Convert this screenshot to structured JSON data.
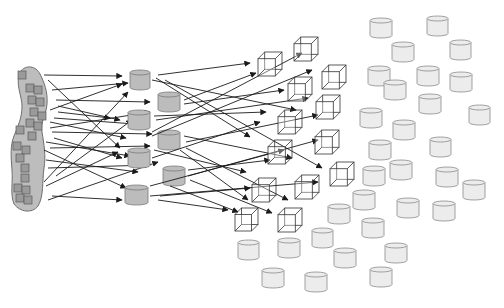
{
  "diagram": {
    "title": "",
    "colors": {
      "background": "#ffffff",
      "blob_fill": "#bdbdbd",
      "blob_stroke": "#6e6e6e",
      "blob_square_fill": "#9a9a9a",
      "blob_square_stroke": "#5a5a5a",
      "gray_cylinder_fill": "#bcbcbc",
      "gray_cylinder_stroke": "#7a7a7a",
      "light_cylinder_fill": "#ececec",
      "light_cylinder_stroke": "#8a8a8a",
      "cube_stroke": "#333333",
      "arrow": "#1a1a1a"
    },
    "source_blob": {
      "name": "source-cluster",
      "squares": [
        [
          22,
          75
        ],
        [
          30,
          88
        ],
        [
          38,
          90
        ],
        [
          32,
          100
        ],
        [
          40,
          102
        ],
        [
          34,
          112
        ],
        [
          42,
          116
        ],
        [
          30,
          123
        ],
        [
          38,
          126
        ],
        [
          20,
          130
        ],
        [
          32,
          136
        ],
        [
          17,
          146
        ],
        [
          26,
          150
        ],
        [
          20,
          158
        ],
        [
          25,
          168
        ],
        [
          25,
          178
        ],
        [
          18,
          188
        ],
        [
          26,
          190
        ],
        [
          20,
          198
        ],
        [
          28,
          200
        ]
      ]
    },
    "gray_cylinders": [
      {
        "x": 130,
        "y": 70,
        "w": 20,
        "h": 20
      },
      {
        "x": 158,
        "y": 92,
        "w": 22,
        "h": 20
      },
      {
        "x": 128,
        "y": 110,
        "w": 22,
        "h": 20
      },
      {
        "x": 158,
        "y": 130,
        "w": 22,
        "h": 20
      },
      {
        "x": 128,
        "y": 148,
        "w": 22,
        "h": 20
      },
      {
        "x": 163,
        "y": 166,
        "w": 22,
        "h": 20
      },
      {
        "x": 125,
        "y": 185,
        "w": 23,
        "h": 20
      }
    ],
    "cubes": [
      {
        "x": 258,
        "y": 52,
        "s": 24
      },
      {
        "x": 294,
        "y": 37,
        "s": 24
      },
      {
        "x": 322,
        "y": 65,
        "s": 24
      },
      {
        "x": 288,
        "y": 77,
        "s": 24
      },
      {
        "x": 316,
        "y": 95,
        "s": 24
      },
      {
        "x": 278,
        "y": 110,
        "s": 24
      },
      {
        "x": 315,
        "y": 130,
        "s": 24
      },
      {
        "x": 268,
        "y": 140,
        "s": 24
      },
      {
        "x": 330,
        "y": 162,
        "s": 24
      },
      {
        "x": 252,
        "y": 178,
        "s": 24
      },
      {
        "x": 295,
        "y": 175,
        "s": 24
      },
      {
        "x": 235,
        "y": 208,
        "s": 23
      },
      {
        "x": 278,
        "y": 208,
        "s": 24
      }
    ],
    "light_cylinders": [
      {
        "x": 370,
        "y": 18,
        "w": 22,
        "h": 20
      },
      {
        "x": 427,
        "y": 16,
        "w": 21,
        "h": 20
      },
      {
        "x": 392,
        "y": 42,
        "w": 22,
        "h": 20
      },
      {
        "x": 450,
        "y": 40,
        "w": 21,
        "h": 20
      },
      {
        "x": 368,
        "y": 66,
        "w": 22,
        "h": 20
      },
      {
        "x": 417,
        "y": 66,
        "w": 22,
        "h": 20
      },
      {
        "x": 450,
        "y": 72,
        "w": 22,
        "h": 20
      },
      {
        "x": 384,
        "y": 80,
        "w": 22,
        "h": 20
      },
      {
        "x": 419,
        "y": 94,
        "w": 22,
        "h": 20
      },
      {
        "x": 469,
        "y": 105,
        "w": 21,
        "h": 20
      },
      {
        "x": 360,
        "y": 108,
        "w": 22,
        "h": 20
      },
      {
        "x": 393,
        "y": 120,
        "w": 22,
        "h": 20
      },
      {
        "x": 430,
        "y": 137,
        "w": 21,
        "h": 20
      },
      {
        "x": 369,
        "y": 140,
        "w": 22,
        "h": 20
      },
      {
        "x": 390,
        "y": 160,
        "w": 22,
        "h": 20
      },
      {
        "x": 363,
        "y": 166,
        "w": 22,
        "h": 20
      },
      {
        "x": 436,
        "y": 167,
        "w": 22,
        "h": 20
      },
      {
        "x": 463,
        "y": 180,
        "w": 22,
        "h": 20
      },
      {
        "x": 353,
        "y": 190,
        "w": 22,
        "h": 20
      },
      {
        "x": 397,
        "y": 198,
        "w": 22,
        "h": 20
      },
      {
        "x": 433,
        "y": 201,
        "w": 22,
        "h": 20
      },
      {
        "x": 328,
        "y": 204,
        "w": 22,
        "h": 20
      },
      {
        "x": 362,
        "y": 218,
        "w": 22,
        "h": 20
      },
      {
        "x": 312,
        "y": 228,
        "w": 21,
        "h": 20
      },
      {
        "x": 238,
        "y": 240,
        "w": 21,
        "h": 20
      },
      {
        "x": 278,
        "y": 238,
        "w": 22,
        "h": 20
      },
      {
        "x": 385,
        "y": 243,
        "w": 22,
        "h": 20
      },
      {
        "x": 334,
        "y": 248,
        "w": 22,
        "h": 20
      },
      {
        "x": 262,
        "y": 268,
        "w": 22,
        "h": 20
      },
      {
        "x": 370,
        "y": 267,
        "w": 22,
        "h": 20
      },
      {
        "x": 305,
        "y": 272,
        "w": 22,
        "h": 20
      }
    ],
    "arrows_stage1": [
      [
        44,
        75,
        122,
        76
      ],
      [
        48,
        80,
        120,
        148
      ],
      [
        52,
        90,
        128,
        83
      ],
      [
        56,
        100,
        150,
        102
      ],
      [
        58,
        106,
        120,
        120
      ],
      [
        58,
        112,
        110,
        118
      ],
      [
        54,
        118,
        148,
        125
      ],
      [
        50,
        122,
        126,
        138
      ],
      [
        52,
        132,
        152,
        134
      ],
      [
        54,
        138,
        122,
        158
      ],
      [
        46,
        142,
        130,
        156
      ],
      [
        50,
        148,
        150,
        146
      ],
      [
        44,
        150,
        126,
        188
      ],
      [
        46,
        160,
        138,
        172
      ],
      [
        48,
        168,
        150,
        165
      ],
      [
        56,
        176,
        132,
        120
      ],
      [
        44,
        182,
        128,
        92
      ],
      [
        52,
        196,
        122,
        200
      ],
      [
        48,
        200,
        158,
        162
      ],
      [
        46,
        186,
        118,
        152
      ],
      [
        50,
        110,
        122,
        84
      ],
      [
        50,
        128,
        150,
        112
      ]
    ],
    "arrows_stage2": [
      [
        158,
        75,
        250,
        63
      ],
      [
        156,
        78,
        250,
        137
      ],
      [
        152,
        80,
        296,
        110
      ],
      [
        184,
        100,
        256,
        73
      ],
      [
        184,
        104,
        284,
        90
      ],
      [
        154,
        116,
        266,
        112
      ],
      [
        156,
        120,
        308,
        98
      ],
      [
        184,
        136,
        292,
        158
      ],
      [
        152,
        132,
        302,
        53
      ],
      [
        152,
        136,
        312,
        70
      ],
      [
        154,
        150,
        246,
        172
      ],
      [
        186,
        142,
        318,
        115
      ],
      [
        186,
        148,
        288,
        200
      ],
      [
        152,
        158,
        260,
        122
      ],
      [
        188,
        170,
        270,
        160
      ],
      [
        188,
        176,
        318,
        140
      ],
      [
        150,
        186,
        284,
        150
      ],
      [
        150,
        196,
        318,
        182
      ],
      [
        160,
        196,
        250,
        188
      ],
      [
        158,
        200,
        228,
        210
      ],
      [
        190,
        180,
        272,
        213
      ],
      [
        170,
        186,
        238,
        212
      ],
      [
        180,
        150,
        248,
        200
      ],
      [
        165,
        80,
        322,
        168
      ]
    ]
  }
}
